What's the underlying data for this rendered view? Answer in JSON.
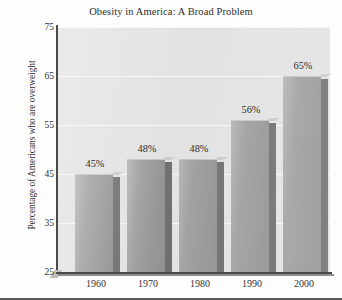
{
  "chart_data": {
    "type": "bar",
    "title": "Obesity in America: A Broad Problem",
    "xlabel": "",
    "ylabel": "Percentage of Americans who are overweight",
    "categories": [
      "1960",
      "1970",
      "1980",
      "1990",
      "2000"
    ],
    "values": [
      45,
      48,
      48,
      56,
      65
    ],
    "data_labels": [
      "45%",
      "48%",
      "48%",
      "56%",
      "65%"
    ],
    "ylim": [
      25,
      75
    ],
    "yticks": [
      25,
      35,
      45,
      55,
      65,
      75
    ],
    "ytick_labels": [
      "25",
      "35",
      "45",
      "55",
      "65",
      "75"
    ],
    "grid": true,
    "legend": false,
    "colors": {
      "plot_background": "#e2e2e2",
      "bar_face": "#9e9e9e",
      "bar_side": "#6e6e6e",
      "gridline": "#f6f6f6",
      "axis": "#4a4a4a",
      "text": "#2e2e2e"
    }
  }
}
